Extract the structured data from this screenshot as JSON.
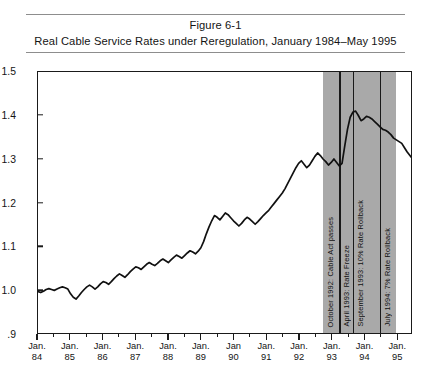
{
  "figure": {
    "number": "Figure 6-1",
    "title": "Real Cable Service Rates under Reregulation, January 1984–May 1995"
  },
  "chart_data": {
    "type": "line",
    "title": "Real Cable Service Rates under Reregulation, January 1984–May 1995",
    "subtitle": "Figure 6-1",
    "xlabel": "",
    "ylabel": "",
    "grid": false,
    "legend": "none",
    "xlim": [
      "Jan. 84",
      "Jan. 95"
    ],
    "ylim": [
      0.9,
      1.5
    ],
    "ytick_labels": [
      "1.5",
      "1.4",
      "1.3",
      "1.2",
      "1.1",
      "1.0",
      ".9"
    ],
    "ytick_values": [
      1.5,
      1.4,
      1.3,
      1.2,
      1.1,
      1.0,
      0.9
    ],
    "xtick_labels": [
      {
        "month": "Jan.",
        "year": "84"
      },
      {
        "month": "Jan.",
        "year": "85"
      },
      {
        "month": "Jan.",
        "year": "86"
      },
      {
        "month": "Jan.",
        "year": "87"
      },
      {
        "month": "Jan.",
        "year": "88"
      },
      {
        "month": "Jan.",
        "year": "89"
      },
      {
        "month": "Jan",
        "year": "90"
      },
      {
        "month": "Jan.",
        "year": "91"
      },
      {
        "month": "Jan.",
        "year": "92"
      },
      {
        "month": "Jan.",
        "year": "93"
      },
      {
        "month": "Jan.",
        "year": "94"
      },
      {
        "month": "Jan.",
        "year": "95"
      }
    ],
    "series": [
      {
        "name": "Real cable service rate index",
        "x_start": "1984-01",
        "x_end": "1995-05",
        "frequency": "monthly",
        "values": [
          0.995,
          0.993,
          0.996,
          1.0,
          1.002,
          1.0,
          0.998,
          1.001,
          1.004,
          1.006,
          1.004,
          1.001,
          0.99,
          0.982,
          0.978,
          0.985,
          0.993,
          1.0,
          1.006,
          1.01,
          1.006,
          1.001,
          1.006,
          1.013,
          1.018,
          1.016,
          1.012,
          1.018,
          1.025,
          1.031,
          1.036,
          1.032,
          1.028,
          1.034,
          1.041,
          1.047,
          1.052,
          1.05,
          1.046,
          1.052,
          1.058,
          1.062,
          1.058,
          1.055,
          1.06,
          1.066,
          1.07,
          1.066,
          1.062,
          1.068,
          1.074,
          1.079,
          1.076,
          1.072,
          1.078,
          1.084,
          1.089,
          1.086,
          1.082,
          1.088,
          1.096,
          1.11,
          1.128,
          1.144,
          1.158,
          1.17,
          1.166,
          1.16,
          1.168,
          1.176,
          1.172,
          1.165,
          1.158,
          1.152,
          1.146,
          1.152,
          1.16,
          1.166,
          1.162,
          1.156,
          1.15,
          1.156,
          1.163,
          1.17,
          1.176,
          1.182,
          1.19,
          1.198,
          1.206,
          1.214,
          1.222,
          1.232,
          1.244,
          1.256,
          1.268,
          1.28,
          1.29,
          1.296,
          1.288,
          1.28,
          1.286,
          1.296,
          1.306,
          1.314,
          1.308,
          1.3,
          1.294,
          1.286,
          1.292,
          1.3,
          1.292,
          1.284,
          1.29,
          1.33,
          1.368,
          1.396,
          1.408,
          1.41,
          1.4,
          1.388,
          1.392,
          1.398,
          1.396,
          1.392,
          1.386,
          1.38,
          1.374,
          1.368,
          1.366,
          1.362,
          1.356,
          1.348,
          1.344,
          1.34,
          1.336,
          1.326,
          1.316,
          1.308,
          1.3,
          1.294,
          1.29,
          1.288,
          1.292,
          1.3,
          1.306,
          1.312,
          1.316,
          1.318,
          1.32
        ],
        "peak_value": 1.41,
        "peak_date": "1993-05",
        "trough_after_peak": 1.288,
        "final_value": 1.32,
        "start_value": 0.995
      }
    ],
    "shaded_region": {
      "label": "Reregulation period",
      "color": "#a9a9a9",
      "start": "1992-10",
      "end": "1995-01"
    },
    "annotations": [
      {
        "id": "cable-act",
        "text": "October 1992: Cable Act passes",
        "date": "1992-10"
      },
      {
        "id": "rate-freeze",
        "text": "April 1993: Rate Freeze",
        "date": "1993-04"
      },
      {
        "id": "rollback-10",
        "text": "September 1993: 10% Rate Rollback",
        "date": "1993-09"
      },
      {
        "id": "rollback-7",
        "text": "July 1994: 7% Rate Rollback",
        "date": "1994-07"
      }
    ]
  }
}
